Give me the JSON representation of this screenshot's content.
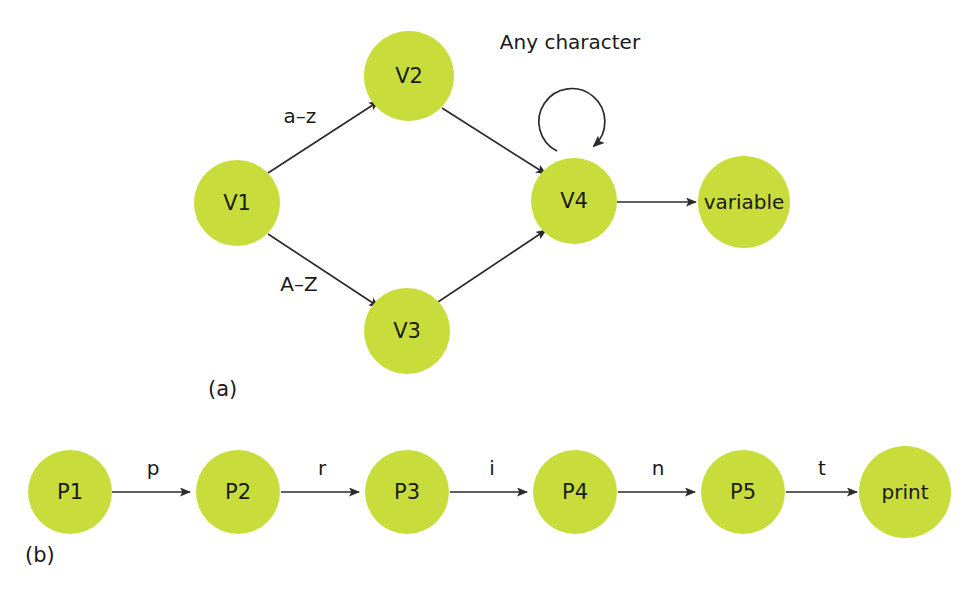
{
  "figure": {
    "background_color": "#ffffff",
    "node_fill_color": "#c8dc3c",
    "edge_color": "#2b2b2b",
    "text_color": "#1a1a1a",
    "width": 975,
    "height": 591
  },
  "panels": [
    {
      "caption": "(a)",
      "caption_x": 208,
      "caption_y": 389,
      "name": "variable-recognizer",
      "nodes": [
        {
          "id": "V1",
          "label": "V1",
          "cx": 237,
          "cy": 203,
          "r": 43
        },
        {
          "id": "V2",
          "label": "V2",
          "cx": 409,
          "cy": 76,
          "r": 45
        },
        {
          "id": "V3",
          "label": "V3",
          "cx": 407,
          "cy": 331,
          "r": 43
        },
        {
          "id": "V4",
          "label": "V4",
          "cx": 574,
          "cy": 201,
          "r": 43
        },
        {
          "id": "variable",
          "label": "variable",
          "cx": 744,
          "cy": 202,
          "r": 46
        }
      ],
      "edges": [
        {
          "from": "V1",
          "to": "V2",
          "label": "a–z",
          "label_x": 300,
          "label_y": 116
        },
        {
          "from": "V1",
          "to": "V3",
          "label": "A–Z",
          "label_x": 299,
          "label_y": 284
        },
        {
          "from": "V2",
          "to": "V4",
          "label": "",
          "label_x": 0,
          "label_y": 0
        },
        {
          "from": "V3",
          "to": "V4",
          "label": "",
          "label_x": 0,
          "label_y": 0
        },
        {
          "from": "V4",
          "to": "variable",
          "label": "",
          "label_x": 0,
          "label_y": 0
        }
      ],
      "self_loops": [
        {
          "on": "V4",
          "label": "Any character",
          "label_x": 570,
          "label_y": 42,
          "arc_cx": 570,
          "arc_cy": 120,
          "arc_r": 33
        }
      ]
    },
    {
      "caption": "(b)",
      "caption_x": 25,
      "caption_y": 555,
      "name": "print-keyword-recognizer",
      "nodes": [
        {
          "id": "P1",
          "label": "P1",
          "cx": 70,
          "cy": 492,
          "r": 42
        },
        {
          "id": "P2",
          "label": "P2",
          "cx": 238,
          "cy": 492,
          "r": 42
        },
        {
          "id": "P3",
          "label": "P3",
          "cx": 407,
          "cy": 492,
          "r": 42
        },
        {
          "id": "P4",
          "label": "P4",
          "cx": 575,
          "cy": 492,
          "r": 42
        },
        {
          "id": "P5",
          "label": "P5",
          "cx": 743,
          "cy": 492,
          "r": 42
        },
        {
          "id": "print",
          "label": "print",
          "cx": 905,
          "cy": 492,
          "r": 46
        }
      ],
      "edges": [
        {
          "from": "P1",
          "to": "P2",
          "label": "p",
          "label_x": 153,
          "label_y": 468
        },
        {
          "from": "P2",
          "to": "P3",
          "label": "r",
          "label_x": 322,
          "label_y": 468
        },
        {
          "from": "P3",
          "to": "P4",
          "label": "i",
          "label_x": 492,
          "label_y": 468
        },
        {
          "from": "P4",
          "to": "P5",
          "label": "n",
          "label_x": 658,
          "label_y": 468
        },
        {
          "from": "P5",
          "to": "print",
          "label": "t",
          "label_x": 822,
          "label_y": 468
        }
      ],
      "self_loops": []
    }
  ]
}
